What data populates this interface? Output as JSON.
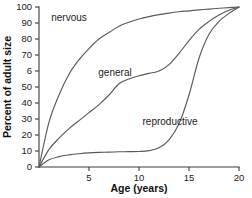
{
  "chart_data": {
    "type": "line",
    "title": "",
    "xlabel": "Age (years)",
    "ylabel": "Percent of adult size",
    "xlim": [
      0,
      20
    ],
    "ylim": [
      0,
      100
    ],
    "grid": false,
    "legend_position": "inline-annotations",
    "xticks": [
      0,
      5,
      10,
      15,
      20
    ],
    "xtick_labels": [
      "",
      "5",
      "10",
      "15",
      "20"
    ],
    "yticks": [
      0,
      10,
      20,
      30,
      40,
      50,
      60,
      70,
      80,
      90,
      100
    ],
    "ytick_labels": [
      "0",
      "10",
      "20",
      "30",
      "40",
      "50",
      "6",
      "70",
      "80",
      "90",
      "100"
    ],
    "x": [
      0,
      1,
      2,
      3,
      4,
      5,
      6,
      7,
      8,
      9,
      10,
      11,
      12,
      13,
      14,
      15,
      16,
      17,
      18,
      19,
      20
    ],
    "series": [
      {
        "name": "nervous",
        "label": "nervous",
        "color": "#57595b",
        "values": [
          0,
          28,
          45,
          58,
          67,
          74,
          80,
          84,
          88,
          90.5,
          92.5,
          94,
          95.2,
          96.2,
          97,
          97.6,
          98.2,
          98.7,
          99.2,
          99.6,
          100
        ]
      },
      {
        "name": "general",
        "label": "general",
        "color": "#57595b",
        "values": [
          0,
          11,
          18,
          24,
          29,
          34,
          39,
          45,
          52,
          55,
          57,
          58.5,
          60,
          64,
          71,
          79,
          86,
          91,
          95,
          98,
          100
        ]
      },
      {
        "name": "reproductive",
        "label": "reproductive",
        "color": "#57595b",
        "values": [
          0,
          4.5,
          6.5,
          7.6,
          8.3,
          8.8,
          9.1,
          9.3,
          9.5,
          9.6,
          9.7,
          10.2,
          12,
          17,
          27,
          45,
          68,
          83,
          91,
          96,
          100
        ]
      }
    ],
    "annotations": [
      {
        "text": "nervous",
        "x": 3.0,
        "y": 91
      },
      {
        "text": "general",
        "x": 7.6,
        "y": 57
      },
      {
        "text": "reproductive",
        "x": 13.1,
        "y": 26
      }
    ]
  },
  "colors": {
    "curve": "#57595b",
    "axis": "#3a3a3a",
    "text": "#1a1a1a",
    "background": "#ffffff"
  }
}
